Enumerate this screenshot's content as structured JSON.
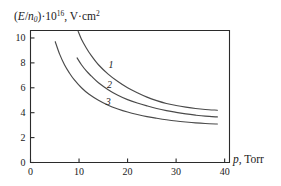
{
  "chart_data": {
    "type": "line",
    "title": "",
    "ylabel": "(E/n0)*10^16, V*cm^2",
    "ylabel_parts": {
      "open_paren": "(",
      "numerator": "E",
      "slash": "/",
      "denominator": "n",
      "denominator_sub": "0",
      "close_paren": ")",
      "dot1": "·",
      "base": "10",
      "exponent": "16",
      "comma": ",",
      "units": "V·cm",
      "units_exponent": "2"
    },
    "xlabel": "p, Torr",
    "xlabel_parts": {
      "symbol": "p",
      "comma_units": ", Torr"
    },
    "xlim": [
      0,
      41
    ],
    "ylim": [
      0,
      10.6
    ],
    "xticks": [
      0,
      10,
      20,
      30,
      40
    ],
    "yticks": [
      0,
      2,
      4,
      6,
      8,
      10
    ],
    "xtick_labels": [
      "0",
      "10",
      "20",
      "30",
      "40"
    ],
    "ytick_labels": [
      "0",
      "2",
      "4",
      "6",
      "8",
      "10"
    ],
    "grid": false,
    "legend": "inline-curve-labels",
    "curve_color": "#4a4a4a",
    "frame_color": "#2b2b2b",
    "series": [
      {
        "name": "1",
        "label": "1",
        "label_position": {
          "x": 16.6,
          "y": 7.55
        },
        "points": [
          [
            9.8,
            10.55
          ],
          [
            10.5,
            9.9
          ],
          [
            11.5,
            9.2
          ],
          [
            12.5,
            8.6
          ],
          [
            14.0,
            7.85
          ],
          [
            16.0,
            7.1
          ],
          [
            18.0,
            6.5
          ],
          [
            20.0,
            6.0
          ],
          [
            22.0,
            5.6
          ],
          [
            24.0,
            5.25
          ],
          [
            26.0,
            4.97
          ],
          [
            28.0,
            4.74
          ],
          [
            30.0,
            4.58
          ],
          [
            32.0,
            4.45
          ],
          [
            34.0,
            4.34
          ],
          [
            36.0,
            4.26
          ],
          [
            38.5,
            4.2
          ]
        ]
      },
      {
        "name": "2",
        "label": "2",
        "label_position": {
          "x": 16.3,
          "y": 5.95
        },
        "points": [
          [
            9.6,
            8.4
          ],
          [
            10.5,
            7.85
          ],
          [
            11.5,
            7.35
          ],
          [
            12.5,
            6.95
          ],
          [
            14.0,
            6.4
          ],
          [
            16.0,
            5.85
          ],
          [
            18.0,
            5.4
          ],
          [
            20.0,
            5.05
          ],
          [
            22.0,
            4.78
          ],
          [
            24.0,
            4.55
          ],
          [
            26.0,
            4.34
          ],
          [
            28.0,
            4.17
          ],
          [
            30.0,
            4.03
          ],
          [
            32.0,
            3.9
          ],
          [
            34.0,
            3.8
          ],
          [
            36.0,
            3.72
          ],
          [
            38.5,
            3.66
          ]
        ]
      },
      {
        "name": "3",
        "label": "3",
        "label_position": {
          "x": 16.0,
          "y": 4.62
        },
        "points": [
          [
            5.1,
            9.7
          ],
          [
            6.0,
            8.7
          ],
          [
            7.0,
            7.85
          ],
          [
            8.0,
            7.2
          ],
          [
            9.0,
            6.65
          ],
          [
            10.5,
            6.0
          ],
          [
            12.0,
            5.5
          ],
          [
            14.0,
            5.0
          ],
          [
            16.0,
            4.6
          ],
          [
            18.0,
            4.3
          ],
          [
            20.0,
            4.05
          ],
          [
            22.0,
            3.85
          ],
          [
            24.0,
            3.68
          ],
          [
            26.0,
            3.55
          ],
          [
            28.0,
            3.43
          ],
          [
            30.0,
            3.33
          ],
          [
            32.0,
            3.25
          ],
          [
            34.0,
            3.18
          ],
          [
            36.0,
            3.13
          ],
          [
            38.5,
            3.09
          ]
        ]
      }
    ]
  },
  "figure": {
    "border_color": "#b0b0b0"
  }
}
